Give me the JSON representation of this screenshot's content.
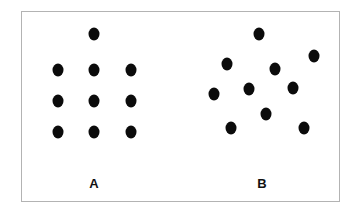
{
  "figure": {
    "title": "",
    "background_color": "#ffffff",
    "frame": {
      "border_color": "#b3b3b3",
      "fill_color": "#ffffff",
      "x": 21,
      "y": 11,
      "width": 319,
      "height": 191
    },
    "dot_color": "#0b0b0b",
    "dot_width": 11,
    "dot_height": 13
  },
  "chart_data": {
    "type": "scatter",
    "title": "",
    "xlabel": "",
    "ylabel": "",
    "grid": false,
    "legend": "none",
    "xlim": [
      21,
      340
    ],
    "ylim": [
      11,
      202
    ],
    "note": "Two dot patterns: A is a regular 3x3 lattice with one extra dot above the centre column (10 dots); B is an irregular random scatter of 10 dots.",
    "series": [
      {
        "name": "A",
        "label": "A",
        "arrangement": "regular-grid",
        "count": 10,
        "label_position": {
          "x": 93,
          "y": 182
        },
        "points": [
          {
            "x": 93,
            "y": 33
          },
          {
            "x": 57,
            "y": 69
          },
          {
            "x": 93,
            "y": 69
          },
          {
            "x": 130,
            "y": 69
          },
          {
            "x": 57,
            "y": 100
          },
          {
            "x": 93,
            "y": 100
          },
          {
            "x": 130,
            "y": 100
          },
          {
            "x": 57,
            "y": 131
          },
          {
            "x": 93,
            "y": 131
          },
          {
            "x": 130,
            "y": 131
          }
        ]
      },
      {
        "name": "B",
        "label": "B",
        "arrangement": "random-scatter",
        "count": 10,
        "label_position": {
          "x": 261,
          "y": 182
        },
        "points": [
          {
            "x": 258,
            "y": 33
          },
          {
            "x": 313,
            "y": 55
          },
          {
            "x": 226,
            "y": 63
          },
          {
            "x": 274,
            "y": 68
          },
          {
            "x": 213,
            "y": 93
          },
          {
            "x": 248,
            "y": 88
          },
          {
            "x": 292,
            "y": 87
          },
          {
            "x": 265,
            "y": 113
          },
          {
            "x": 230,
            "y": 127
          },
          {
            "x": 303,
            "y": 127
          }
        ]
      }
    ]
  }
}
